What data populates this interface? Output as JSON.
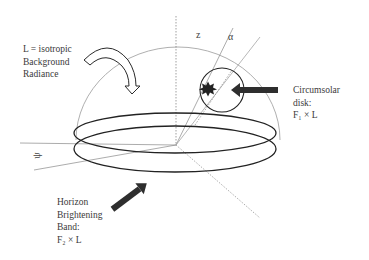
{
  "figure": {
    "labels": {
      "background": [
        "L = isotropic",
        "Background",
        "Radiance"
      ],
      "circumsolar": [
        "Circumsolar",
        "disk:",
        "F₁ × L"
      ],
      "horizon": [
        "Horizon",
        "Brightening",
        "Band:",
        "F₂ × L"
      ]
    },
    "axes": {
      "zenith_angle": "z",
      "altitude_angle": "α",
      "azimuth_angle": "ψ"
    },
    "colors": {
      "dome": "#9a9a9a",
      "band": "#222222",
      "arrow_fill": "#2e2e2e",
      "text": "#3a3a3a"
    }
  }
}
